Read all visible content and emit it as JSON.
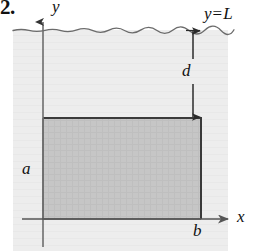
{
  "figure": {
    "problem_number": "2.",
    "type": "geometry-diagram",
    "labels": {
      "y_axis": "y",
      "x_axis": "x",
      "surface_variable": "y",
      "surface_operator": "=",
      "surface_level": "L",
      "depth": "d",
      "height": "a",
      "width": "b"
    },
    "colors": {
      "fluid_fill": "#ececec",
      "plate_fill": "#c6c6c6",
      "plate_stroke": "#3a3a3a",
      "axis_stroke": "#555555",
      "surface_stroke": "#6b6b6b",
      "label_color": "#111111",
      "page_background": "#ffffff"
    },
    "geometry": {
      "fluid_region": {
        "x": 13,
        "y": 30,
        "width": 215,
        "height": 221
      },
      "surface_line_y": 30,
      "origin": {
        "x": 43,
        "y": 219
      },
      "y_axis": {
        "x": 43,
        "top": 17,
        "bottom": 247
      },
      "x_axis": {
        "y": 219,
        "left": 22,
        "right": 234
      },
      "plate": {
        "x": 43,
        "y": 118,
        "width": 158,
        "height": 101
      },
      "depth_arrow": {
        "x": 193,
        "top": 31,
        "bottom": 117
      }
    }
  }
}
